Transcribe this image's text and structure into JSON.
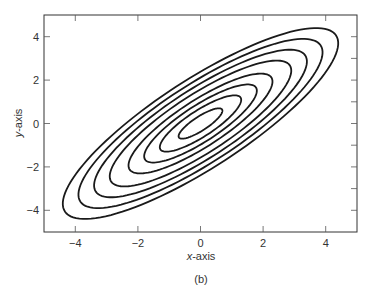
{
  "chart_data": {
    "type": "contour",
    "title": "",
    "caption": "(b)",
    "xlabel": "x-axis",
    "ylabel": "y-axis",
    "xlim": [
      -5,
      5
    ],
    "ylim": [
      -5,
      5
    ],
    "xticks": [
      -4,
      -2,
      0,
      2,
      4
    ],
    "yticks": [
      -4,
      -2,
      0,
      2,
      4
    ],
    "xtick_labels": [
      "−4",
      "−2",
      "0",
      "2",
      "4"
    ],
    "ytick_labels": [
      "−4",
      "−2",
      "0",
      "2",
      "4"
    ],
    "right_minor_ticks": [
      -4,
      -3,
      -2,
      -1,
      0,
      1,
      2,
      3,
      4
    ],
    "grid": false,
    "legend": null,
    "center": [
      0,
      0
    ],
    "correlation": 0.84,
    "contours": [
      {
        "level": 1,
        "x_extent": 0.7
      },
      {
        "level": 2,
        "x_extent": 1.3
      },
      {
        "level": 3,
        "x_extent": 1.8
      },
      {
        "level": 4,
        "x_extent": 2.3
      },
      {
        "level": 5,
        "x_extent": 2.9
      },
      {
        "level": 6,
        "x_extent": 3.4
      },
      {
        "level": 7,
        "x_extent": 3.9
      },
      {
        "level": 8,
        "x_extent": 4.4
      }
    ],
    "line_color": "#1a1a1a"
  }
}
